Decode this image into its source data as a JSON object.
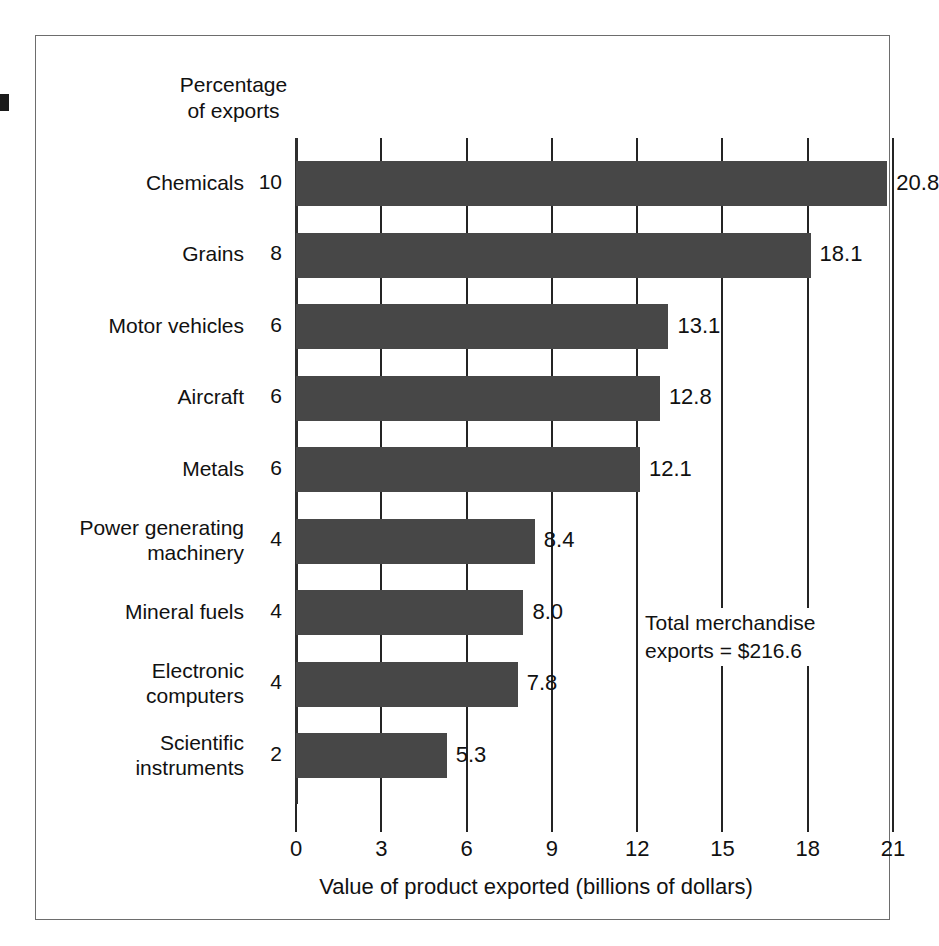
{
  "figure": {
    "percentage_header": "Percentage\nof exports",
    "total_annotation": "Total merchandise\nexports  =  $216.6"
  },
  "chart_data": {
    "type": "bar",
    "orientation": "horizontal",
    "title": "",
    "xlabel": "Value of product exported (billions of dollars)",
    "ylabel": "",
    "xlim": [
      0,
      21
    ],
    "xticks": [
      "0",
      "3",
      "6",
      "9",
      "12",
      "15",
      "18",
      "21"
    ],
    "xtick_values": [
      0,
      3,
      6,
      9,
      12,
      15,
      18,
      21
    ],
    "grid": true,
    "legend": false,
    "bar_color": "#474747",
    "categories": [
      "Chemicals",
      "Grains",
      "Motor vehicles",
      "Aircraft",
      "Metals",
      "Power generating\nmachinery",
      "Mineral fuels",
      "Electronic\ncomputers",
      "Scientific\ninstruments"
    ],
    "values": [
      20.8,
      18.1,
      13.1,
      12.8,
      12.1,
      8.4,
      8.0,
      7.8,
      5.3
    ],
    "value_labels": [
      "20.8",
      "18.1",
      "13.1",
      "12.8",
      "12.1",
      "8.4",
      "8.0",
      "7.8",
      "5.3"
    ],
    "percent_of_exports": [
      "10",
      "8",
      "6",
      "6",
      "6",
      "4",
      "4",
      "4",
      "2"
    ],
    "percent_of_exports_values": [
      10,
      8,
      6,
      6,
      6,
      4,
      4,
      4,
      2
    ],
    "annotations": [
      "Total merchandise exports  =  $216.6"
    ],
    "units": "billions of dollars",
    "total_merchandise_exports": "216.6"
  }
}
